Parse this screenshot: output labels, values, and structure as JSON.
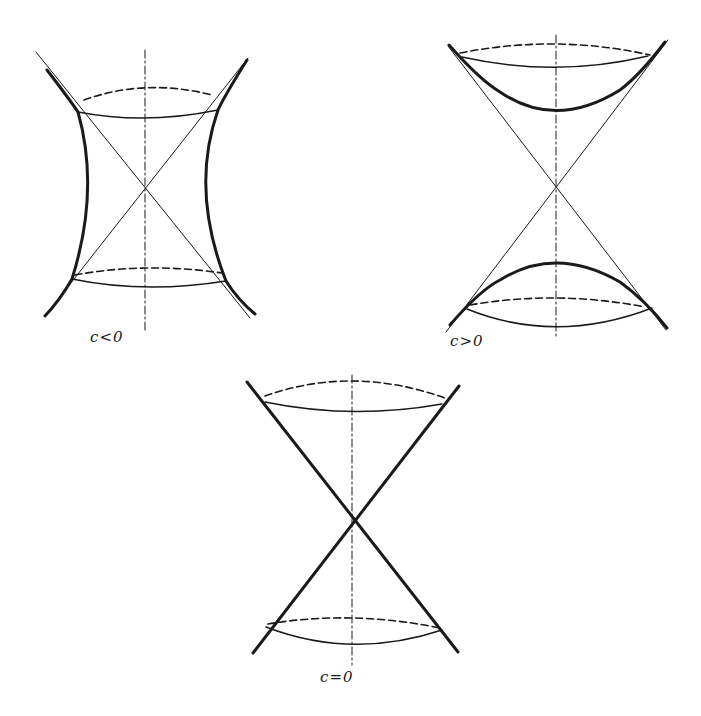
{
  "figure": {
    "panels": [
      {
        "id": "hyperboloid-one-sheet",
        "label": "c<0",
        "description": "one-sheeted hyperboloid with asymptotic cone"
      },
      {
        "id": "hyperboloid-two-sheets",
        "label": "c>0",
        "description": "two-sheeted hyperboloid with asymptotic cone"
      },
      {
        "id": "double-cone",
        "label": "c=0",
        "description": "double cone"
      }
    ],
    "colors": {
      "ink": "#1a1a1a",
      "background": "#ffffff"
    }
  }
}
